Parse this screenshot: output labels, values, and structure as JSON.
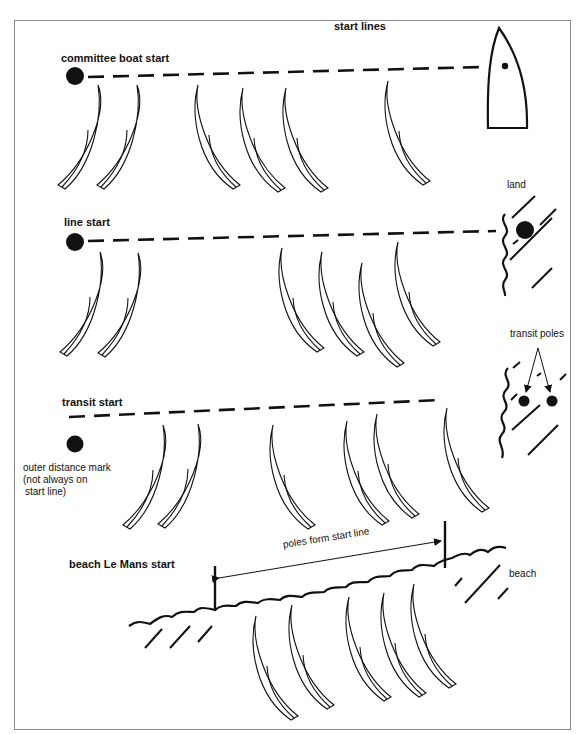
{
  "title": "start lines",
  "sections": {
    "committee": {
      "label": "committee boat start"
    },
    "line": {
      "label": "line start",
      "land_label": "land"
    },
    "transit": {
      "label": "transit start",
      "poles_label": "transit poles",
      "outer_mark_label_1": "outer distance mark",
      "outer_mark_label_2": "(not always on",
      "outer_mark_label_3": "start line)"
    },
    "beach": {
      "label": "beach Le Mans start",
      "poles_label": "poles form start line",
      "beach_label": "beach"
    }
  },
  "colors": {
    "ink": "#111111",
    "frame": "#8a8a8a",
    "background": "#ffffff"
  }
}
